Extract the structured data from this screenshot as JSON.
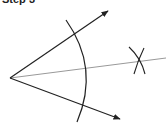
{
  "title": "Step 3",
  "diagram": {
    "type": "geometric-construction",
    "vertex": {
      "x": 10,
      "y": 78
    },
    "rays": [
      {
        "name": "upper-ray",
        "from": [
          10,
          78
        ],
        "to": [
          108,
          11
        ]
      },
      {
        "name": "lower-ray",
        "from": [
          10,
          78
        ],
        "to": [
          120,
          119
        ]
      }
    ],
    "main_arc": {
      "center": [
        10,
        78
      ],
      "radius": 80
    },
    "bisector": {
      "from": [
        10,
        78
      ],
      "to": [
        166,
        58
      ]
    },
    "intersection_arcs_point": [
      140,
      61
    ],
    "colors": {
      "ray": "#222222",
      "arc": "#222222",
      "bisector": "#999999",
      "background": "#ffffff"
    }
  }
}
